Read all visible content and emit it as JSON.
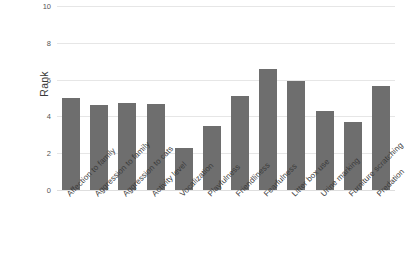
{
  "chart_data": {
    "type": "bar",
    "title": "",
    "xlabel": "",
    "ylabel": "Rank",
    "ylim": [
      0,
      10
    ],
    "yticks": [
      0,
      2,
      4,
      6,
      8,
      10
    ],
    "ytick_labels": [
      "0",
      "2",
      "4",
      "6",
      "8",
      "10"
    ],
    "grid": true,
    "legend": "none",
    "bar_color": "#6e6e6e",
    "gridline_color": "#e6e6e6",
    "background_color": "#ffffff",
    "categories": [
      "Affection to family",
      "Aggression to family",
      "Aggression to cats",
      "Activity level",
      "Vocalization",
      "Playfulness",
      "Friendliness",
      "Fearfulness",
      "Litter box use",
      "Urine marking",
      "Furniture scratching",
      "Predation"
    ],
    "values": [
      5.0,
      4.6,
      4.75,
      4.7,
      2.3,
      3.5,
      5.1,
      6.6,
      5.9,
      4.3,
      3.7,
      5.65
    ]
  }
}
